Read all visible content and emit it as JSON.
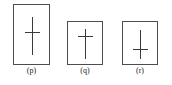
{
  "figure": {
    "background_color": "#ffffff",
    "border_color": "#4d4d4d",
    "mark_color": "#3a3a3a",
    "caption_color": "#1a1a1a",
    "panels": [
      {
        "id": "p",
        "label": "(p)",
        "shape": "portrait-rectangle",
        "mark": "cross",
        "crossbar_position": "above-center",
        "stem_longer_side": "below"
      },
      {
        "id": "q",
        "label": "(q)",
        "shape": "square",
        "mark": "cross",
        "crossbar_position": "upper",
        "stem_longer_side": "below"
      },
      {
        "id": "r",
        "label": "(r)",
        "shape": "square",
        "mark": "cross",
        "crossbar_position": "lower",
        "stem_longer_side": "above"
      }
    ]
  }
}
